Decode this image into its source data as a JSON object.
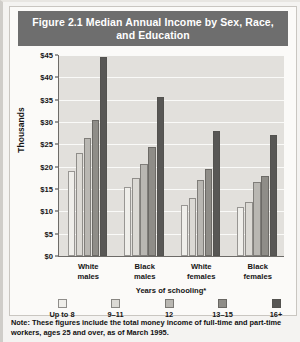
{
  "figure": {
    "title": "Figure 2.1  Median Annual Income by Sex, Race, and Education",
    "note": "Note: These figures include the total money income of full-time and part-time workers, ages 25 and over, as of March 1995."
  },
  "colors": {
    "title_bar_background": "#6e6e6e",
    "title_text": "#ffffff",
    "plot_background": "#e2e0dc",
    "gridline": "#fafaf8",
    "axis": "#6d6b68",
    "page_background": "#f4f3f1",
    "panel_background": "#fbfaf8",
    "series": [
      "#efeeea",
      "#dbd9d4",
      "#b9b7b2",
      "#8f8d88",
      "#585755"
    ]
  },
  "chart_data": {
    "type": "bar",
    "title": "Figure 2.1  Median Annual Income by Sex, Race, and Education",
    "xlabel": "Years of schooling*",
    "ylabel": "Thousands",
    "ylim": [
      0,
      45
    ],
    "ytick_values": [
      0,
      5,
      10,
      15,
      20,
      25,
      30,
      35,
      40,
      45
    ],
    "ytick_labels": [
      "$0",
      "$5",
      "$10",
      "$15",
      "$20",
      "$25",
      "$30",
      "$35",
      "$40",
      "$45"
    ],
    "grid": true,
    "legend_position": "bottom",
    "categories": [
      "White\nmales",
      "Black\nmales",
      "White\nfemales",
      "Black\nfemales"
    ],
    "category_labels": [
      {
        "line1": "White",
        "line2": "males"
      },
      {
        "line1": "Black",
        "line2": "males"
      },
      {
        "line1": "White",
        "line2": "females"
      },
      {
        "line1": "Black",
        "line2": "females"
      }
    ],
    "series": [
      {
        "name": "Up to 8",
        "values": [
          19.0,
          15.5,
          11.5,
          11.0
        ]
      },
      {
        "name": "9–11",
        "values": [
          23.0,
          17.5,
          13.0,
          12.0
        ]
      },
      {
        "name": "12",
        "values": [
          26.5,
          20.5,
          17.0,
          16.5
        ]
      },
      {
        "name": "13–15",
        "values": [
          30.5,
          24.5,
          19.5,
          18.0
        ]
      },
      {
        "name": "16+",
        "values": [
          44.5,
          35.5,
          28.0,
          27.0
        ]
      }
    ]
  },
  "legend": {
    "items": [
      {
        "label": "Up to 8"
      },
      {
        "label": "9–11"
      },
      {
        "label": "12"
      },
      {
        "label": "13–15"
      },
      {
        "label": "16+"
      }
    ]
  }
}
